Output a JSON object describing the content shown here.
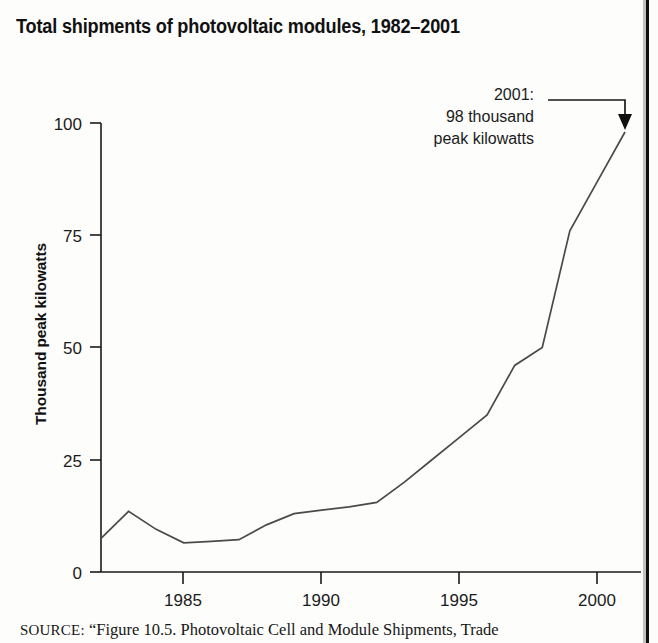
{
  "figure": {
    "title": "Total shipments of photovoltaic modules, 1982–2001",
    "source_label": "SOURCE:",
    "source_text": "“Figure 10.5. Photovoltaic Cell and Module Shipments, Trade"
  },
  "annotation": {
    "line1": "2001:",
    "line2": "98 thousand",
    "line3": "peak kilowatts"
  },
  "colors": {
    "line": "#4a4a4a",
    "axis": "#1a1a1a",
    "text": "#1a1a1a",
    "background": "#fdfdfc",
    "page_edge": "#0f0f0f"
  },
  "chart_data": {
    "type": "line",
    "title": "Total shipments of photovoltaic modules, 1982–2001",
    "xlabel": "",
    "ylabel": "Thousand peak kilowatts",
    "xlim": [
      1982,
      2001
    ],
    "ylim": [
      0,
      100
    ],
    "grid": false,
    "legend": null,
    "xticks": [
      1985,
      1990,
      1995,
      2000
    ],
    "xtick_labels": [
      "1985",
      "1990",
      "1995",
      "2000"
    ],
    "yticks": [
      0,
      25,
      50,
      75,
      100
    ],
    "ytick_labels": [
      "0",
      "25",
      "50",
      "75",
      "100"
    ],
    "x": [
      1982,
      1983,
      1984,
      1985,
      1986,
      1987,
      1988,
      1989,
      1990,
      1991,
      1992,
      1993,
      1994,
      1995,
      1996,
      1997,
      1998,
      1999,
      2000,
      2001
    ],
    "values": [
      7.5,
      13.5,
      9.5,
      6.5,
      6.8,
      7.2,
      10.5,
      13.0,
      13.8,
      14.5,
      15.5,
      20.0,
      25.0,
      30.0,
      35.0,
      46.0,
      50.0,
      76.0,
      87.0,
      98.0
    ],
    "series": [
      {
        "name": "Total shipments",
        "values": [
          7.5,
          13.5,
          9.5,
          6.5,
          6.8,
          7.2,
          10.5,
          13.0,
          13.8,
          14.5,
          15.5,
          20.0,
          25.0,
          30.0,
          35.0,
          46.0,
          50.0,
          76.0,
          87.0,
          98.0
        ]
      }
    ],
    "annotations": [
      {
        "text": "2001: 98 thousand peak kilowatts",
        "target_x": 2001,
        "target_y": 98
      }
    ]
  }
}
